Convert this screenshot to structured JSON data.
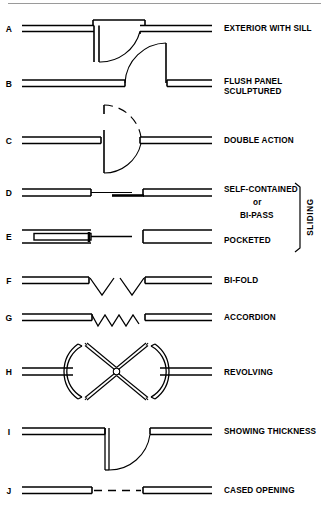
{
  "sheet": {
    "title": "Door Types Plan Symbols",
    "background_color": "#ffffff",
    "ink_color": "#000000",
    "rule_color": "#9a9a9a"
  },
  "group_bracket": {
    "label": "SLIDING",
    "covers_rows": [
      "D",
      "E"
    ]
  },
  "rows": [
    {
      "key": "A",
      "letter": "A",
      "label": "EXTERIOR WITH SILL",
      "label_lines": [
        "EXTERIOR WITH SILL"
      ],
      "symbol": "exterior-with-sill",
      "description": "Wall sections left and right with sill threshold, door leaf swinging down-left with quarter-circle swing arc"
    },
    {
      "key": "B",
      "letter": "B",
      "label": "FLUSH PANEL SCULPTURED",
      "label_lines": [
        "FLUSH PANEL",
        "SCULPTURED"
      ],
      "symbol": "flush-panel-sculptured",
      "description": "Wall sections with door leaf swinging up-right and quarter-circle swing arc"
    },
    {
      "key": "C",
      "letter": "C",
      "label": "DOUBLE ACTION",
      "label_lines": [
        "DOUBLE ACTION"
      ],
      "symbol": "double-action",
      "description": "Wall sections with vertical door leaf and dashed plus solid swing arcs both directions"
    },
    {
      "key": "D",
      "letter": "D",
      "label": "SELF-CONTAINED or BI-PASS",
      "label_lines": [
        "SELF-CONTAINED",
        "or",
        "BI-PASS"
      ],
      "symbol": "self-contained-bi-pass",
      "description": "Two offset sliding panels passing one another between wall sections"
    },
    {
      "key": "E",
      "letter": "E",
      "label": "POCKETED",
      "label_lines": [
        "POCKETED"
      ],
      "symbol": "pocketed",
      "description": "Sliding panel recessed into wall pocket cavity with track line"
    },
    {
      "key": "F",
      "letter": "F",
      "label": "BI-FOLD",
      "label_lines": [
        "BI-FOLD"
      ],
      "symbol": "bi-fold",
      "description": "Two V-shaped folding leaf pairs between wall sections"
    },
    {
      "key": "G",
      "letter": "G",
      "label": "ACCORDION",
      "label_lines": [
        "ACCORDION"
      ],
      "symbol": "accordion",
      "description": "Zigzag accordion folding partition between wall sections"
    },
    {
      "key": "H",
      "letter": "H",
      "label": "REVOLVING",
      "label_lines": [
        "REVOLVING"
      ],
      "symbol": "revolving",
      "description": "Circular enclosure with two curved side walls and four wings forming an X"
    },
    {
      "key": "I",
      "letter": "I",
      "label": "SHOWING THICKNESS",
      "label_lines": [
        "SHOWING THICKNESS"
      ],
      "symbol": "showing-thickness",
      "description": "Wall sections with double-line door leaf drawn at true thickness and swing arc"
    },
    {
      "key": "J",
      "letter": "J",
      "label": "CASED OPENING",
      "label_lines": [
        "CASED OPENING"
      ],
      "symbol": "cased-opening",
      "description": "Wall sections with dashed line across the opening, no door leaf"
    }
  ]
}
